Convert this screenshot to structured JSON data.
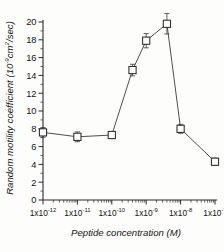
{
  "chart_data": {
    "type": "line",
    "title": "",
    "subtitle": "",
    "xlabel": "Peptide concentration (M)",
    "ylabel": "Random motility coefficient (10-9cm2/sec)",
    "ylabel_parts": {
      "main_a": "Random motility coefficient (10",
      "exp": "-9",
      "main_b": "cm",
      "sq": "2",
      "main_c": "/sec)"
    },
    "xlabel_parts": {
      "text": "Peptide concentration (M)"
    },
    "xscale": "log",
    "yscale": "linear",
    "xlim": [
      1e-12,
      1e-07
    ],
    "ylim": [
      0,
      20
    ],
    "grid": false,
    "legend": "none",
    "marker_style": "open-square",
    "x_tick_labels": [
      {
        "mantissa": "1x10",
        "exponent": "-12",
        "value": 1e-12
      },
      {
        "mantissa": "1x10",
        "exponent": "-11",
        "value": 1e-11
      },
      {
        "mantissa": "1x10",
        "exponent": "-10",
        "value": 1e-10
      },
      {
        "mantissa": "1x10",
        "exponent": "-9",
        "value": 1e-09
      },
      {
        "mantissa": "1x10",
        "exponent": "-8",
        "value": 1e-08
      },
      {
        "mantissa": "1x10",
        "exponent": "-7",
        "value": 1e-07
      }
    ],
    "y_tick_labels": [
      "0",
      "2",
      "4",
      "6",
      "8",
      "10",
      "12",
      "14",
      "16",
      "18",
      "20"
    ],
    "y_tick_values": [
      0,
      2,
      4,
      6,
      8,
      10,
      12,
      14,
      16,
      18,
      20
    ],
    "y_minor_step": 1,
    "points": [
      {
        "x": 1e-12,
        "y": 7.6,
        "err": 0.55
      },
      {
        "x": 1e-11,
        "y": 7.1,
        "err": 0.55
      },
      {
        "x": 1e-10,
        "y": 7.3,
        "err": 0.35
      },
      {
        "x": 4e-10,
        "y": 14.6,
        "err": 0.65
      },
      {
        "x": 1e-09,
        "y": 17.9,
        "err": 0.8
      },
      {
        "x": 4e-09,
        "y": 19.8,
        "err": 1.15
      },
      {
        "x": 1e-08,
        "y": 8.0,
        "err": 0.5
      },
      {
        "x": 1e-07,
        "y": 4.3,
        "err": 0.4
      }
    ],
    "series": [
      {
        "name": "Random motility coefficient",
        "x": [
          1e-12,
          1e-11,
          1e-10,
          4e-10,
          1e-09,
          4e-09,
          1e-08,
          1e-07
        ],
        "values": [
          7.6,
          7.1,
          7.3,
          14.6,
          17.9,
          19.8,
          8.0,
          4.3
        ],
        "errors": [
          0.55,
          0.55,
          0.35,
          0.65,
          0.8,
          1.15,
          0.5,
          0.4
        ]
      }
    ],
    "colors": {
      "axis": "#2b2b2b",
      "line": "#3a3a3a",
      "marker_fill": "#ffffff",
      "marker_stroke": "#2b2b2b",
      "background": "#fdfdfb"
    }
  }
}
